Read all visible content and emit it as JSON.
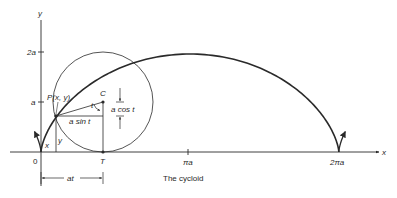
{
  "diagram": {
    "caption": "The cycloid",
    "axes": {
      "x_label": "x",
      "y_label": "y",
      "origin_label": "0",
      "y_ticks": [
        {
          "label": "2a",
          "value": 2
        },
        {
          "label": "a",
          "value": 1
        }
      ],
      "x_ticks": [
        {
          "label": "πa",
          "value": 3.14159
        },
        {
          "label": "2πa",
          "value": 6.28318
        }
      ]
    },
    "point_labels": {
      "P": "P(x, y)",
      "C": "C",
      "T": "T"
    },
    "annotations": {
      "a_cos_t": "a cos t",
      "a_sin_t": "a sin t",
      "angle_t": "t",
      "x_coord": "x",
      "y_coord": "y",
      "at": "at"
    },
    "geometry": {
      "origin_px": [
        41,
        152
      ],
      "a_px_horizontal": 47.4,
      "a_px_vertical": 49,
      "t_parameter": 1.28
    },
    "colors": {
      "ink": "#2a2a2a",
      "background": "#ffffff"
    }
  }
}
